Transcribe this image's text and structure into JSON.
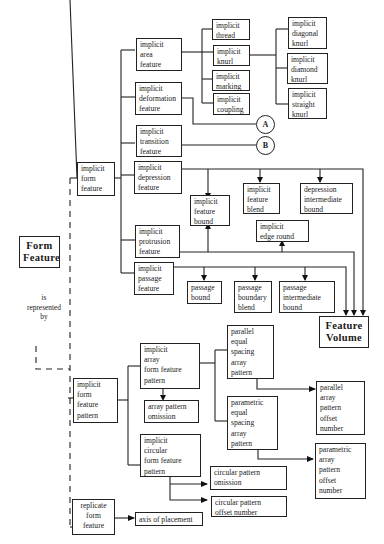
{
  "diagram": {
    "root": {
      "label": "Form\nFeature"
    },
    "relation_label": "is\nrepresented\nby",
    "feature_volume": {
      "label": "Feature\nVolume"
    },
    "implicit_form_feature": {
      "label": "implicit\n form\nfeature",
      "children": {
        "area": {
          "label": "implicit\n area\nfeature"
        },
        "deformation": {
          "label": "implicit\ndeformation\nfeature"
        },
        "transition": {
          "label": "implicit\ntransition\nfeature"
        },
        "depression": {
          "label": "implicit\ndepression\nfeature"
        },
        "protrusion": {
          "label": "implicit\nprotrusion\nfeature"
        },
        "passage": {
          "label": "implicit\npassage\nfeature"
        }
      },
      "area_children": {
        "thread": {
          "label": "implicit\nthread"
        },
        "knurl": {
          "label": "implicit\nknurl"
        },
        "marking": {
          "label": "implicit\nmarking"
        },
        "coupling": {
          "label": "implicit\ncoupling"
        }
      },
      "knurl_children": {
        "diagonal": {
          "label": "implicit\ndiagonal\nknurl"
        },
        "diamond": {
          "label": "implicit\ndiamond\nknurl"
        },
        "straight": {
          "label": "implicit\nstraight\nknurl"
        }
      },
      "connectors": {
        "a": "A",
        "b": "B"
      },
      "depression_children": {
        "feature_bound": {
          "label": "implicit\nfeature\nbound"
        },
        "feature_blend": {
          "label": "implicit\nfeature\nblend"
        },
        "intermediate_bound": {
          "label": "depression\nintermediate\nbound"
        },
        "edge_round": {
          "label": "implicit\nedge round"
        }
      },
      "passage_children": {
        "passage_bound": {
          "label": "passage\nbound"
        },
        "boundary_blend": {
          "label": "passage\nboundary\nblend"
        },
        "intermediate_bound": {
          "label": "passage\nintermediate\nbound"
        }
      }
    },
    "implicit_form_feature_pattern": {
      "label": "implicit\n form\nfeature\npattern",
      "array": {
        "label": "implicit\narray\nform feature\npattern"
      },
      "array_omission": {
        "label": "array pattern\nomission"
      },
      "parallel_equal": {
        "label": "parallel\nequal\nspacing\narray\npattern"
      },
      "parametric_equal": {
        "label": "parametric\nequal\nspacing\narray\npattern"
      },
      "parallel_offset": {
        "label": "parallel\narray\npattern\noffset\nnumber"
      },
      "parametric_offset": {
        "label": "parametric\narray\npattern\noffset\nnumber"
      },
      "circular": {
        "label": "implicit\ncircular\nform feature\npattern"
      },
      "circular_omission": {
        "label": "circular pattern\nomission"
      },
      "circular_offset": {
        "label": "circular pattern\noffset number"
      }
    },
    "replicate_form_feature": {
      "label": "replicate\n form\nfeature",
      "axis": {
        "label": "axis of placement"
      }
    }
  }
}
